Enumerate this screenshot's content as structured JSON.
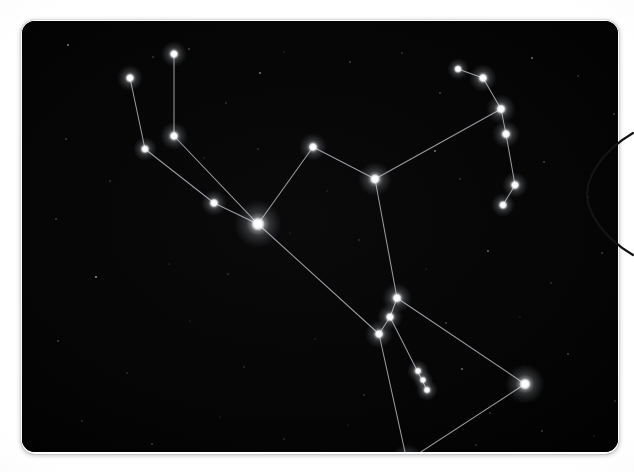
{
  "scene": {
    "kind": "astronomy-photo",
    "subject": "Orion constellation night sky photograph",
    "sky_color": "#050505",
    "star_color": "#ffffff",
    "line_color": "#b9bcc4",
    "surround_color": "#ffffff",
    "arc_color": "#1a1a1a"
  },
  "photo": {
    "x": 22,
    "y": 21,
    "width": 596,
    "height": 431,
    "corner_radius": 13
  },
  "ring_arc": {
    "label": "circle-edge-arc",
    "x": 612,
    "y": 131,
    "width": 56,
    "height": 126,
    "stroke": "#141414",
    "stroke_width": 2.2
  },
  "chart_data": {
    "type": "scatter",
    "xlabel": "",
    "ylabel": "",
    "xlim": [
      0,
      596
    ],
    "ylim": [
      0,
      431
    ],
    "grid": false,
    "legend": "none",
    "stars": [
      {
        "id": "s1",
        "name": "upper-club-tip",
        "x": 152,
        "y": 33,
        "r": 4.2,
        "glow": 13
      },
      {
        "id": "s2",
        "name": "upper-left-arm-tip",
        "x": 108,
        "y": 57,
        "r": 4.2,
        "glow": 13
      },
      {
        "id": "s3",
        "name": "club-mid",
        "x": 152,
        "y": 115,
        "r": 4.4,
        "glow": 14
      },
      {
        "id": "s4",
        "name": "arm-elbow",
        "x": 123,
        "y": 128,
        "r": 4.0,
        "glow": 12
      },
      {
        "id": "s5",
        "name": "arm-wrist",
        "x": 192,
        "y": 182,
        "r": 4.3,
        "glow": 13
      },
      {
        "id": "s6",
        "name": "bellatrix-shoulder",
        "x": 236,
        "y": 203,
        "r": 6.6,
        "glow": 24
      },
      {
        "id": "s7",
        "name": "upper-body-peak",
        "x": 291,
        "y": 126,
        "r": 4.4,
        "glow": 14
      },
      {
        "id": "s8",
        "name": "betelgeuse-shoulder",
        "x": 353,
        "y": 158,
        "r": 5.0,
        "glow": 17
      },
      {
        "id": "s9",
        "name": "bow-tip-top",
        "x": 436,
        "y": 48,
        "r": 3.8,
        "glow": 11
      },
      {
        "id": "s10",
        "name": "bow-upper",
        "x": 461,
        "y": 57,
        "r": 4.4,
        "glow": 14
      },
      {
        "id": "s11",
        "name": "bow-joint",
        "x": 479,
        "y": 88,
        "r": 4.6,
        "glow": 15
      },
      {
        "id": "s12",
        "name": "bow-mid",
        "x": 484,
        "y": 113,
        "r": 4.4,
        "glow": 14
      },
      {
        "id": "s13",
        "name": "bow-lower",
        "x": 493,
        "y": 164,
        "r": 4.2,
        "glow": 13
      },
      {
        "id": "s14",
        "name": "bow-tip-bottom",
        "x": 481,
        "y": 184,
        "r": 4.0,
        "glow": 12
      },
      {
        "id": "s15",
        "name": "belt-star-left",
        "x": 375,
        "y": 277,
        "r": 4.6,
        "glow": 15
      },
      {
        "id": "s16",
        "name": "belt-star-center",
        "x": 368,
        "y": 296,
        "r": 4.2,
        "glow": 13
      },
      {
        "id": "s17",
        "name": "belt-star-right",
        "x": 357,
        "y": 313,
        "r": 4.4,
        "glow": 14
      },
      {
        "id": "s18",
        "name": "sword-upper",
        "x": 396,
        "y": 350,
        "r": 3.4,
        "glow": 11
      },
      {
        "id": "s19",
        "name": "sword-middle",
        "x": 401,
        "y": 359,
        "r": 3.2,
        "glow": 10
      },
      {
        "id": "s20",
        "name": "sword-lower",
        "x": 405,
        "y": 369,
        "r": 3.4,
        "glow": 11
      },
      {
        "id": "s21",
        "name": "saiph-foot",
        "x": 503,
        "y": 363,
        "r": 5.6,
        "glow": 20
      },
      {
        "id": "s22",
        "name": "rigel-foot",
        "x": 385,
        "y": 440,
        "r": 5.0,
        "glow": 17
      }
    ],
    "lines": [
      {
        "from": "s2",
        "to": "s4"
      },
      {
        "from": "s1",
        "to": "s3"
      },
      {
        "from": "s4",
        "to": "s5"
      },
      {
        "from": "s3",
        "to": "s6"
      },
      {
        "from": "s5",
        "to": "s6"
      },
      {
        "from": "s6",
        "to": "s7"
      },
      {
        "from": "s7",
        "to": "s8"
      },
      {
        "from": "s8",
        "to": "s11"
      },
      {
        "from": "s9",
        "to": "s10"
      },
      {
        "from": "s10",
        "to": "s11"
      },
      {
        "from": "s11",
        "to": "s12"
      },
      {
        "from": "s12",
        "to": "s13"
      },
      {
        "from": "s13",
        "to": "s14"
      },
      {
        "from": "s8",
        "to": "s15"
      },
      {
        "from": "s6",
        "to": "s17"
      },
      {
        "from": "s15",
        "to": "s16"
      },
      {
        "from": "s16",
        "to": "s17"
      },
      {
        "from": "s15",
        "to": "s21"
      },
      {
        "from": "s17",
        "to": "s22"
      },
      {
        "from": "s22",
        "to": "s21"
      },
      {
        "from": "s16",
        "to": "s20"
      }
    ],
    "background_stars": [
      {
        "x": 46,
        "y": 24,
        "r": 0.9,
        "o": 0.55
      },
      {
        "x": 131,
        "y": 36,
        "r": 0.7,
        "o": 0.4
      },
      {
        "x": 167,
        "y": 28,
        "r": 0.8,
        "o": 0.45
      },
      {
        "x": 204,
        "y": 82,
        "r": 0.7,
        "o": 0.35
      },
      {
        "x": 238,
        "y": 52,
        "r": 0.9,
        "o": 0.5
      },
      {
        "x": 262,
        "y": 31,
        "r": 0.6,
        "o": 0.3
      },
      {
        "x": 328,
        "y": 41,
        "r": 0.8,
        "o": 0.42
      },
      {
        "x": 380,
        "y": 32,
        "r": 0.7,
        "o": 0.35
      },
      {
        "x": 418,
        "y": 72,
        "r": 0.8,
        "o": 0.4
      },
      {
        "x": 510,
        "y": 37,
        "r": 0.9,
        "o": 0.48
      },
      {
        "x": 556,
        "y": 55,
        "r": 0.7,
        "o": 0.33
      },
      {
        "x": 592,
        "y": 93,
        "r": 0.8,
        "o": 0.4
      },
      {
        "x": 44,
        "y": 118,
        "r": 0.8,
        "o": 0.42
      },
      {
        "x": 88,
        "y": 160,
        "r": 0.7,
        "o": 0.35
      },
      {
        "x": 182,
        "y": 137,
        "r": 0.6,
        "o": 0.3
      },
      {
        "x": 236,
        "y": 128,
        "r": 0.7,
        "o": 0.33
      },
      {
        "x": 305,
        "y": 170,
        "r": 0.6,
        "o": 0.28
      },
      {
        "x": 413,
        "y": 130,
        "r": 0.9,
        "o": 0.5
      },
      {
        "x": 438,
        "y": 158,
        "r": 0.7,
        "o": 0.35
      },
      {
        "x": 522,
        "y": 141,
        "r": 0.8,
        "o": 0.4
      },
      {
        "x": 566,
        "y": 176,
        "r": 0.7,
        "o": 0.33
      },
      {
        "x": 34,
        "y": 198,
        "r": 0.8,
        "o": 0.4
      },
      {
        "x": 74,
        "y": 256,
        "r": 1.0,
        "o": 0.58
      },
      {
        "x": 147,
        "y": 243,
        "r": 0.6,
        "o": 0.28
      },
      {
        "x": 206,
        "y": 253,
        "r": 0.7,
        "o": 0.32
      },
      {
        "x": 268,
        "y": 212,
        "r": 0.6,
        "o": 0.27
      },
      {
        "x": 337,
        "y": 219,
        "r": 0.7,
        "o": 0.33
      },
      {
        "x": 404,
        "y": 248,
        "r": 0.6,
        "o": 0.28
      },
      {
        "x": 466,
        "y": 230,
        "r": 0.9,
        "o": 0.47
      },
      {
        "x": 529,
        "y": 262,
        "r": 0.7,
        "o": 0.34
      },
      {
        "x": 580,
        "y": 232,
        "r": 0.8,
        "o": 0.38
      },
      {
        "x": 36,
        "y": 320,
        "r": 0.8,
        "o": 0.42
      },
      {
        "x": 105,
        "y": 352,
        "r": 0.7,
        "o": 0.33
      },
      {
        "x": 168,
        "y": 300,
        "r": 0.6,
        "o": 0.28
      },
      {
        "x": 222,
        "y": 346,
        "r": 0.7,
        "o": 0.32
      },
      {
        "x": 293,
        "y": 318,
        "r": 0.6,
        "o": 0.27
      },
      {
        "x": 342,
        "y": 374,
        "r": 0.7,
        "o": 0.34
      },
      {
        "x": 440,
        "y": 348,
        "r": 0.9,
        "o": 0.46
      },
      {
        "x": 468,
        "y": 392,
        "r": 0.7,
        "o": 0.33
      },
      {
        "x": 546,
        "y": 333,
        "r": 0.8,
        "o": 0.4
      },
      {
        "x": 593,
        "y": 380,
        "r": 0.7,
        "o": 0.32
      },
      {
        "x": 60,
        "y": 400,
        "r": 0.7,
        "o": 0.33
      },
      {
        "x": 130,
        "y": 423,
        "r": 0.8,
        "o": 0.38
      },
      {
        "x": 198,
        "y": 396,
        "r": 0.6,
        "o": 0.27
      },
      {
        "x": 262,
        "y": 418,
        "r": 0.7,
        "o": 0.32
      },
      {
        "x": 326,
        "y": 404,
        "r": 0.6,
        "o": 0.26
      },
      {
        "x": 454,
        "y": 424,
        "r": 0.7,
        "o": 0.33
      },
      {
        "x": 520,
        "y": 410,
        "r": 0.8,
        "o": 0.38
      },
      {
        "x": 572,
        "y": 415,
        "r": 0.6,
        "o": 0.28
      },
      {
        "x": 424,
        "y": 302,
        "r": 0.8,
        "o": 0.44
      },
      {
        "x": 498,
        "y": 296,
        "r": 0.6,
        "o": 0.27
      }
    ]
  }
}
